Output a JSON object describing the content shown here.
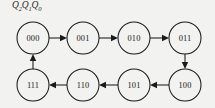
{
  "diagram": {
    "type": "state-transition-graph",
    "title_label": "Q2Q1Q0",
    "title_label_parts": {
      "base": "Q",
      "subscripts": [
        "2",
        "1",
        "0"
      ]
    },
    "background_color": "#f2f2f0",
    "stroke_color": "#1a1a1a",
    "node_radius": 16,
    "nodes": [
      {
        "id": "n000",
        "label": "000",
        "cx": 33,
        "cy": 38,
        "row": "top"
      },
      {
        "id": "n001",
        "label": "001",
        "cx": 83,
        "cy": 38,
        "row": "top"
      },
      {
        "id": "n010",
        "label": "010",
        "cx": 134,
        "cy": 38,
        "row": "top"
      },
      {
        "id": "n011",
        "label": "011",
        "cx": 185,
        "cy": 38,
        "row": "top"
      },
      {
        "id": "n100",
        "label": "100",
        "cx": 185,
        "cy": 85,
        "row": "bottom"
      },
      {
        "id": "n101",
        "label": "101",
        "cx": 134,
        "cy": 85,
        "row": "bottom"
      },
      {
        "id": "n110",
        "label": "110",
        "cx": 83,
        "cy": 85,
        "row": "bottom"
      },
      {
        "id": "n111",
        "label": "111",
        "cx": 33,
        "cy": 85,
        "row": "bottom"
      }
    ],
    "edges": [
      {
        "id": "e1",
        "from": "000",
        "to": "001",
        "direction": "right"
      },
      {
        "id": "e2",
        "from": "001",
        "to": "010",
        "direction": "right"
      },
      {
        "id": "e3",
        "from": "010",
        "to": "011",
        "direction": "right"
      },
      {
        "id": "e4",
        "from": "011",
        "to": "100",
        "direction": "down"
      },
      {
        "id": "e5",
        "from": "100",
        "to": "101",
        "direction": "left"
      },
      {
        "id": "e6",
        "from": "101",
        "to": "110",
        "direction": "left"
      },
      {
        "id": "e7",
        "from": "110",
        "to": "111",
        "direction": "left"
      },
      {
        "id": "e8",
        "from": "111",
        "to": "000",
        "direction": "up"
      }
    ],
    "cycle_sequence": [
      "000",
      "001",
      "010",
      "011",
      "100",
      "101",
      "110",
      "111"
    ]
  }
}
